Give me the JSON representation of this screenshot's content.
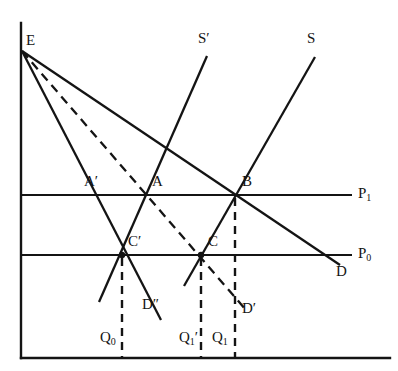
{
  "figure": {
    "type": "economics-supply-demand-diagram",
    "background_color": "#ffffff",
    "ink_color": "#141414",
    "width": 398,
    "height": 371
  },
  "axes": {
    "vertical_axis_name": "price-axis",
    "horizontal_axis_name": "quantity-axis",
    "vertical_x": 21,
    "horizontal_y": 358,
    "vertical_top": 23,
    "horizontal_right": 390
  },
  "price_levels": [
    {
      "id": "p1",
      "label": "P",
      "subscript": "1",
      "y": 195,
      "x_start": 21,
      "x_end": 352,
      "label_x": 358,
      "label_y": 186
    },
    {
      "id": "p0",
      "label": "P",
      "subscript": "0",
      "y": 255,
      "x_start": 21,
      "x_end": 352,
      "label_x": 358,
      "label_y": 246
    }
  ],
  "curves": [
    {
      "id": "d-double-prime",
      "label": "D",
      "prime": "″",
      "style": "solid",
      "role": "demand",
      "points": "22,51 161,320",
      "label_x": 142,
      "label_y": 297
    },
    {
      "id": "d-prime",
      "label": "D",
      "prime": "′",
      "style": "dashed",
      "role": "demand",
      "points": "22,51 246,310",
      "label_x": 242,
      "label_y": 301
    },
    {
      "id": "d",
      "label": "D",
      "prime": "",
      "style": "solid",
      "role": "demand",
      "points": "22,51 340,265",
      "label_x": 336,
      "label_y": 264
    },
    {
      "id": "s-prime",
      "label": "S",
      "prime": "′",
      "style": "solid",
      "role": "supply",
      "points": "99,302 207,56",
      "label_x": 198,
      "label_y": 31
    },
    {
      "id": "s",
      "label": "S",
      "prime": "",
      "style": "solid",
      "role": "supply",
      "points": "184,286 315,57",
      "label_x": 307,
      "label_y": 31
    }
  ],
  "equilibrium_points": [
    {
      "id": "e",
      "label": "E",
      "prime": "",
      "x": 22,
      "y": 51,
      "label_x": 26,
      "label_y": 33,
      "dot": false
    },
    {
      "id": "a-prime",
      "label": "A",
      "prime": "′",
      "x": 93,
      "y": 195,
      "label_x": 84,
      "label_y": 174,
      "dot": false
    },
    {
      "id": "a",
      "label": "A",
      "prime": "",
      "x": 148,
      "y": 195,
      "label_x": 152,
      "label_y": 174,
      "dot": false
    },
    {
      "id": "b",
      "label": "B",
      "prime": "",
      "x": 235,
      "y": 195,
      "label_x": 242,
      "label_y": 174,
      "dot": false
    },
    {
      "id": "c-prime",
      "label": "C",
      "prime": "′",
      "x": 122,
      "y": 255,
      "label_x": 128,
      "label_y": 234,
      "dot": true
    },
    {
      "id": "c",
      "label": "C",
      "prime": "",
      "x": 201,
      "y": 255,
      "label_x": 208,
      "label_y": 234,
      "dot": true
    }
  ],
  "quantity_markers": [
    {
      "id": "q0",
      "label": "Q",
      "subscript": "0",
      "prime": "",
      "x": 122,
      "y_top": 258,
      "y_bottom": 357,
      "label_x": 100,
      "label_y": 330
    },
    {
      "id": "q1-prime",
      "label": "Q",
      "subscript": "1",
      "prime": "′",
      "x": 201,
      "y_top": 258,
      "y_bottom": 357,
      "label_x": 179,
      "label_y": 330
    },
    {
      "id": "q1",
      "label": "Q",
      "subscript": "1",
      "prime": "",
      "x": 235,
      "y_top": 198,
      "y_bottom": 357,
      "label_x": 212,
      "label_y": 330
    }
  ],
  "chart_data": {
    "type": "line",
    "title": "",
    "xlabel": "Quantity",
    "ylabel": "Price",
    "grid": false,
    "legend": "inline-curve-labels",
    "series": [
      {
        "name": "D",
        "kind": "demand",
        "style": "solid",
        "from": [
          22,
          51
        ],
        "to": [
          340,
          265
        ]
      },
      {
        "name": "D′",
        "kind": "demand",
        "style": "dashed",
        "from": [
          22,
          51
        ],
        "to": [
          246,
          310
        ]
      },
      {
        "name": "D″",
        "kind": "demand",
        "style": "solid",
        "from": [
          22,
          51
        ],
        "to": [
          161,
          320
        ]
      },
      {
        "name": "S",
        "kind": "supply",
        "style": "solid",
        "from": [
          184,
          286
        ],
        "to": [
          315,
          57
        ]
      },
      {
        "name": "S′",
        "kind": "supply",
        "style": "solid",
        "from": [
          99,
          302
        ],
        "to": [
          207,
          56
        ]
      }
    ],
    "price_lines": [
      {
        "name": "P₀",
        "y": 255
      },
      {
        "name": "P₁",
        "y": 195
      }
    ],
    "intersections": [
      {
        "name": "E",
        "at": [
          22,
          51
        ],
        "meaning": "common demand-curve origin on price axis"
      },
      {
        "name": "A′",
        "at": [
          93,
          195
        ],
        "meaning": "D″ at price P₁"
      },
      {
        "name": "A",
        "at": [
          148,
          195
        ],
        "meaning": "S′ and D′ at price P₁"
      },
      {
        "name": "B",
        "at": [
          235,
          195
        ],
        "meaning": "S and D at price P₁"
      },
      {
        "name": "C′",
        "at": [
          122,
          255
        ],
        "meaning": "S′ and D″ at price P₀, quantity Q₀"
      },
      {
        "name": "C",
        "at": [
          201,
          255
        ],
        "meaning": "S and D′ at price P₀, quantity Q₁′"
      }
    ],
    "quantities": [
      {
        "name": "Q₀",
        "x": 122
      },
      {
        "name": "Q₁′",
        "x": 201
      },
      {
        "name": "Q₁",
        "x": 235
      }
    ]
  }
}
